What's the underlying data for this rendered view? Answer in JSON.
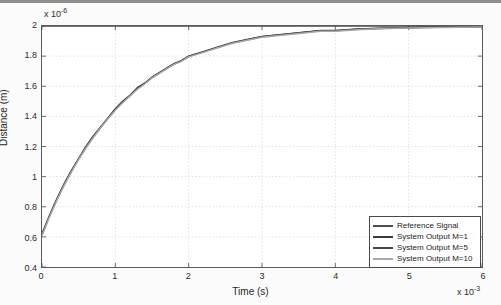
{
  "chart_data": {
    "type": "line",
    "title": "",
    "xlabel": "Time (s)",
    "ylabel": "Distance (m)",
    "x_multiplier": "x 10",
    "x_exponent": "-3",
    "y_multiplier": "x 10",
    "y_exponent": "-6",
    "xlim": [
      0,
      6
    ],
    "ylim": [
      0.4,
      2
    ],
    "xticks": [
      "0",
      "1",
      "2",
      "3",
      "4",
      "5",
      "6"
    ],
    "yticks": [
      "0.4",
      "0.6",
      "0.8",
      "1",
      "1.2",
      "1.4",
      "1.6",
      "1.8",
      "2"
    ],
    "grid": true,
    "legend_position": "lower right",
    "x_units_note": "x values in units of 1e-3 s",
    "y_units_note": "y values in units of 1e-6 m",
    "x": [
      0,
      0.1,
      0.2,
      0.3,
      0.4,
      0.5,
      0.6,
      0.7,
      0.8,
      0.9,
      1.0,
      1.1,
      1.2,
      1.3,
      1.4,
      1.5,
      1.6,
      1.7,
      1.8,
      1.9,
      2.0,
      2.2,
      2.4,
      2.6,
      2.8,
      3.0,
      3.2,
      3.4,
      3.6,
      3.8,
      4.0,
      4.3,
      4.6,
      5.0,
      5.4,
      6.0
    ],
    "series": [
      {
        "name": "Reference Signal",
        "color": "#4d4d4d",
        "width": 1.6,
        "values": [
          2,
          2,
          2,
          2,
          2,
          2,
          2,
          2,
          2,
          2,
          2,
          2,
          2,
          2,
          2,
          2,
          2,
          2,
          2,
          2,
          2,
          2,
          2,
          2,
          2,
          2,
          2,
          2,
          2,
          2,
          2,
          2,
          2,
          2,
          2,
          2
        ]
      },
      {
        "name": "System Output M=1",
        "color": "#3a3a3a",
        "width": 1.5,
        "values": [
          0.62,
          0.74,
          0.85,
          0.95,
          1.04,
          1.12,
          1.2,
          1.27,
          1.33,
          1.39,
          1.45,
          1.5,
          1.54,
          1.59,
          1.62,
          1.66,
          1.69,
          1.72,
          1.75,
          1.77,
          1.8,
          1.83,
          1.86,
          1.89,
          1.91,
          1.93,
          1.94,
          1.95,
          1.96,
          1.97,
          1.97,
          1.98,
          1.985,
          1.99,
          1.993,
          1.996
        ]
      },
      {
        "name": "System Output M=5",
        "color": "#454545",
        "width": 1.5,
        "values": [
          0.615,
          0.735,
          0.845,
          0.945,
          1.035,
          1.118,
          1.195,
          1.265,
          1.328,
          1.388,
          1.445,
          1.495,
          1.538,
          1.585,
          1.618,
          1.658,
          1.688,
          1.718,
          1.748,
          1.768,
          1.798,
          1.828,
          1.858,
          1.888,
          1.908,
          1.928,
          1.938,
          1.948,
          1.958,
          1.968,
          1.968,
          1.978,
          1.983,
          1.988,
          1.991,
          1.994
        ]
      },
      {
        "name": "System Output M=10",
        "color": "#a8a8a8",
        "width": 1.5,
        "values": [
          0.61,
          0.73,
          0.84,
          0.94,
          1.03,
          1.115,
          1.19,
          1.26,
          1.325,
          1.385,
          1.44,
          1.49,
          1.535,
          1.58,
          1.615,
          1.655,
          1.685,
          1.715,
          1.745,
          1.765,
          1.795,
          1.825,
          1.855,
          1.885,
          1.905,
          1.925,
          1.935,
          1.945,
          1.955,
          1.965,
          1.965,
          1.975,
          1.981,
          1.986,
          1.99,
          1.993
        ]
      }
    ]
  },
  "legend": {
    "items": [
      {
        "label": "Reference Signal"
      },
      {
        "label": "System Output M=1"
      },
      {
        "label": "System Output M=5"
      },
      {
        "label": "System Output M=10"
      }
    ]
  },
  "colors": {
    "axis": "#5a5a5a",
    "grid": "#d9d9d9",
    "text": "#1f1f1f",
    "figure_background": "#fbfbfb",
    "axes_background": "#ffffff"
  }
}
